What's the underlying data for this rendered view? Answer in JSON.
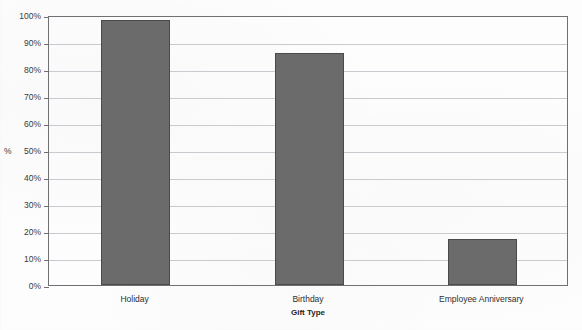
{
  "chart_data": {
    "type": "bar",
    "title": "",
    "xlabel": "Gift Type",
    "ylabel": "%",
    "categories": [
      "Holiday",
      "Birthday",
      "Employee Anniversary"
    ],
    "values": [
      98,
      86,
      17
    ],
    "ylim": [
      0,
      100
    ],
    "ytick_labels": [
      "0%",
      "10%",
      "20%",
      "30%",
      "40%",
      "50%",
      "60%",
      "70%",
      "80%",
      "90%",
      "100%"
    ],
    "ytick_values": [
      0,
      10,
      20,
      30,
      40,
      50,
      60,
      70,
      80,
      90,
      100
    ],
    "grid": true,
    "legend": false,
    "bar_color": "#6b6b6b",
    "bar_border_color": "#4a4a4a",
    "gridline_color": "#c9c9cf",
    "axis_color": "#6f6f74",
    "background_color": "#fdfdfd"
  },
  "axis": {
    "y_title": "%",
    "x_title": "Gift Type"
  },
  "ticks": {
    "y": [
      {
        "label": "100%",
        "value": 100
      },
      {
        "label": "90%",
        "value": 90
      },
      {
        "label": "80%",
        "value": 80
      },
      {
        "label": "70%",
        "value": 70
      },
      {
        "label": "60%",
        "value": 60
      },
      {
        "label": "50%",
        "value": 50
      },
      {
        "label": "40%",
        "value": 40
      },
      {
        "label": "30%",
        "value": 30
      },
      {
        "label": "20%",
        "value": 20
      },
      {
        "label": "10%",
        "value": 10
      },
      {
        "label": "0%",
        "value": 0
      }
    ]
  },
  "bars": [
    {
      "label": "Holiday",
      "value": 98
    },
    {
      "label": "Birthday",
      "value": 86
    },
    {
      "label": "Employee Anniversary",
      "value": 17
    }
  ]
}
